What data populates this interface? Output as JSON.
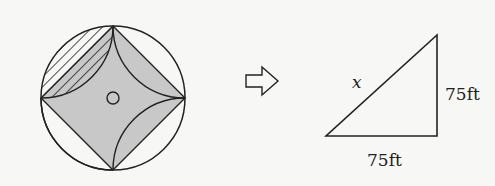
{
  "figure": {
    "left_diagram": {
      "description": "circle with inscribed square and concave four-point star; top-left lens hatched",
      "shade_color": "#c8c8c8",
      "stroke_color": "#222222"
    },
    "arrow": "hollow-right-arrow",
    "triangle": {
      "hypotenuse_label": "x",
      "vertical_leg_label": "75ft",
      "horizontal_leg_label": "75ft"
    }
  }
}
